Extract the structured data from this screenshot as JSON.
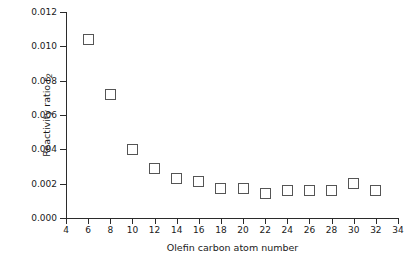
{
  "chart_data": {
    "type": "scatter",
    "title": "",
    "xlabel": "Olefin carbon atom number",
    "ylabel": "Reactivity ratio r",
    "ylabel_sub": "2",
    "x": [
      6,
      8,
      10,
      12,
      14,
      16,
      18,
      20,
      22,
      24,
      26,
      28,
      30,
      32
    ],
    "values": [
      0.0104,
      0.0072,
      0.004,
      0.0029,
      0.0023,
      0.0021,
      0.0017,
      0.0017,
      0.0014,
      0.0016,
      0.0016,
      0.0016,
      0.002,
      0.0016
    ],
    "xlim": [
      4,
      34
    ],
    "ylim": [
      0.0,
      0.012
    ],
    "xticks": [
      4,
      6,
      8,
      10,
      12,
      14,
      16,
      18,
      20,
      22,
      24,
      26,
      28,
      30,
      32,
      34
    ],
    "xtick_labels": [
      "4",
      "6",
      "8",
      "10",
      "12",
      "14",
      "16",
      "18",
      "20",
      "22",
      "24",
      "26",
      "28",
      "30",
      "32",
      "34"
    ],
    "yticks": [
      0.0,
      0.002,
      0.004,
      0.006,
      0.008,
      0.01,
      0.012
    ],
    "ytick_labels": [
      "0.000",
      "0.002",
      "0.004",
      "0.006",
      "0.008",
      "0.010",
      "0.012"
    ],
    "grid": false,
    "legend": null,
    "marker": "open-square",
    "marker_color": "#555555",
    "series_name": "Reactivity ratio r2 vs olefin carbon atom number"
  }
}
